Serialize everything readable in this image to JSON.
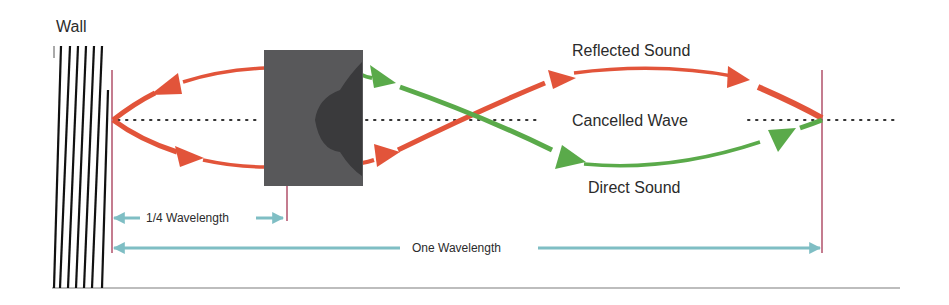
{
  "diagram": {
    "labels": {
      "wall": "Wall",
      "reflected": "Reflected Sound",
      "cancelled": "Cancelled Wave",
      "direct": "Direct Sound",
      "quarter_wavelength": "1/4 Wavelength",
      "one_wavelength": "One Wavelength"
    },
    "colors": {
      "reflected": "#e2543a",
      "direct": "#5aaa4a",
      "dimension": "#7fbec4",
      "marker_line": "#b0506a",
      "speaker_box": "#58585a",
      "speaker_driver": "#3a3a3c",
      "wall_lines": "#111111",
      "dotted_axis": "#333333",
      "floor": "#bdbdbd"
    },
    "elements": [
      {
        "id": "wall",
        "type": "hatched-boundary"
      },
      {
        "id": "speaker",
        "type": "box-with-driver"
      },
      {
        "id": "reflected-path",
        "type": "arrow-curve"
      },
      {
        "id": "direct-path",
        "type": "arrow-curve"
      },
      {
        "id": "center-axis",
        "type": "dotted-line"
      },
      {
        "id": "quarter-wavelength-dim",
        "type": "dimension-arrow"
      },
      {
        "id": "one-wavelength-dim",
        "type": "dimension-arrow"
      }
    ]
  }
}
